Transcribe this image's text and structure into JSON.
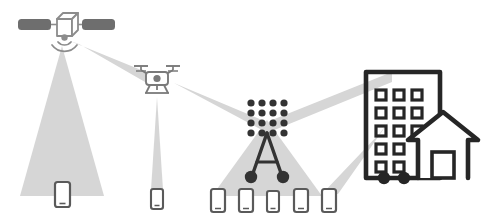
{
  "diagram": {
    "canvas": {
      "width": 489,
      "height": 223,
      "background": "#ffffff"
    },
    "colors": {
      "beam_light": "#d9d9d9",
      "beam_mid": "#cfcfcf",
      "satellite_panel": "#6e6e6e",
      "satellite_body_stroke": "#8c8c8c",
      "drone_stroke": "#7a7a7a",
      "tower_dark": "#333333",
      "building_stroke": "#262626",
      "phone_stroke": "#5a5a5a",
      "phone_fill": "#ffffff"
    },
    "nodes": [
      {
        "id": "satellite",
        "label": "satellite",
        "icon": "satellite-icon",
        "x": 62,
        "y": 32,
        "description": "Cube body with two solar panel wings and downward radio waves"
      },
      {
        "id": "drone",
        "label": "drone",
        "icon": "drone-icon",
        "x": 157,
        "y": 78,
        "description": "Quadcopter with four rotors, camera body and landing skids"
      },
      {
        "id": "cell-tower",
        "label": "cell tower",
        "icon": "cell-tower-icon",
        "x": 267,
        "y": 135,
        "description": "Antenna array of 16 dots over an A-frame mast with two round footings"
      },
      {
        "id": "building",
        "label": "building",
        "icon": "building-icon",
        "x": 412,
        "y": 130,
        "description": "Apartment block with window grid joined to a pitched-roof house"
      }
    ],
    "devices": [
      {
        "id": "phone-satellite",
        "label": "phone",
        "icon": "smartphone-icon",
        "x": 62,
        "y": 197,
        "size": "large",
        "served_by": "satellite"
      },
      {
        "id": "phone-drone",
        "label": "phone",
        "icon": "smartphone-icon",
        "x": 157,
        "y": 200,
        "size": "small",
        "served_by": "drone"
      },
      {
        "id": "phone-tower-1",
        "label": "phone",
        "icon": "smartphone-icon",
        "x": 218,
        "y": 201,
        "size": "medium",
        "served_by": "cell-tower"
      },
      {
        "id": "phone-tower-2",
        "label": "phone",
        "icon": "smartphone-icon",
        "x": 246,
        "y": 201,
        "size": "medium",
        "served_by": "cell-tower"
      },
      {
        "id": "phone-tower-3",
        "label": "phone",
        "icon": "smartphone-icon",
        "x": 273,
        "y": 202,
        "size": "small",
        "served_by": "cell-tower"
      },
      {
        "id": "phone-tower-4",
        "label": "phone",
        "icon": "smartphone-icon",
        "x": 301,
        "y": 201,
        "size": "medium",
        "served_by": "cell-tower"
      },
      {
        "id": "phone-tower-5",
        "label": "phone",
        "icon": "smartphone-icon",
        "x": 329,
        "y": 201,
        "size": "medium",
        "served_by": "cell-tower"
      }
    ],
    "links": [
      {
        "id": "beam-satellite-ground",
        "from": "satellite",
        "to": "phone-satellite",
        "shape": "wide-cone",
        "label": "satellite coverage beam"
      },
      {
        "id": "beam-satellite-drone",
        "from": "satellite",
        "to": "drone",
        "shape": "narrow-cone",
        "label": "satellite to drone feeder link"
      },
      {
        "id": "beam-drone-ground",
        "from": "drone",
        "to": "phone-drone",
        "shape": "narrow-cone",
        "label": "drone coverage beam"
      },
      {
        "id": "beam-drone-tower",
        "from": "drone",
        "to": "cell-tower",
        "shape": "narrow-cone",
        "label": "drone to tower backhaul"
      },
      {
        "id": "beam-tower-ground",
        "from": "cell-tower",
        "to": "phone-tower-group",
        "shape": "wide-cone",
        "label": "tower coverage beam"
      },
      {
        "id": "beam-tower-building",
        "from": "cell-tower",
        "to": "building",
        "shape": "narrow-cone",
        "label": "tower to building link"
      },
      {
        "id": "beam-building-ground",
        "from": "building",
        "to": "phone-tower-5",
        "shape": "narrow-cone",
        "label": "building downlink beam"
      }
    ]
  }
}
